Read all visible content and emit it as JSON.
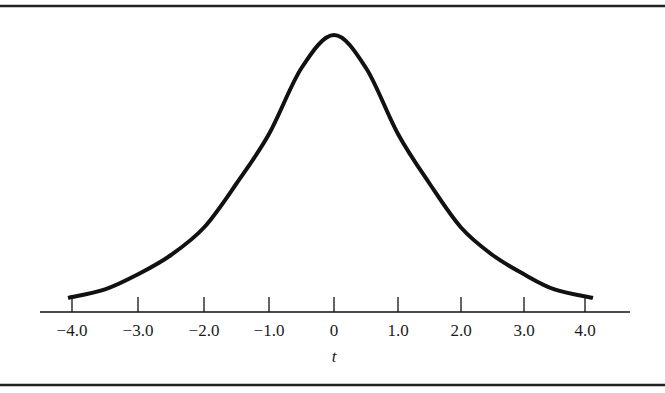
{
  "chart_data": {
    "type": "line",
    "title": "",
    "xlabel": "t",
    "ylabel": "",
    "xlim": [
      -4.0,
      4.0
    ],
    "grid": false,
    "legend": null,
    "x_ticks": [
      -4.0,
      -3.0,
      -2.0,
      -1.0,
      0,
      1.0,
      2.0,
      3.0,
      4.0
    ],
    "x_tick_labels": [
      "−4.0",
      "−3.0",
      "−2.0",
      "−1.0",
      "0",
      "1.0",
      "2.0",
      "3.0",
      "4.0"
    ],
    "series": [
      {
        "name": "t-distribution density",
        "x": [
          -4.0,
          -3.5,
          -3.0,
          -2.5,
          -2.0,
          -1.5,
          -1.0,
          -0.5,
          0,
          0.5,
          1.0,
          1.5,
          2.0,
          2.5,
          3.0,
          3.5,
          4.0
        ],
        "y_relative": [
          0.044,
          0.075,
          0.13,
          0.2,
          0.3,
          0.46,
          0.64,
          0.88,
          1.0,
          0.88,
          0.64,
          0.46,
          0.3,
          0.2,
          0.13,
          0.075,
          0.044
        ]
      }
    ]
  },
  "layout": {
    "tick_px": [
      72,
      138,
      204,
      269,
      334,
      398,
      461,
      524,
      585
    ],
    "baseline_y": 312,
    "peak_height_px": 275,
    "colors": {
      "ink": "#111111",
      "background": "#ffffff"
    }
  }
}
